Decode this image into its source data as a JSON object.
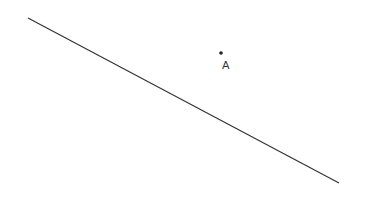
{
  "diagram": {
    "background": "#ffffff",
    "line": {
      "x1": 28,
      "y1": 18,
      "x2": 339,
      "y2": 183,
      "color": "#333333",
      "width": 1.2
    },
    "point": {
      "name": "A",
      "cx": 221,
      "cy": 53,
      "r": 1.8,
      "color": "#222222",
      "label_x": 222,
      "label_y": 69
    }
  }
}
